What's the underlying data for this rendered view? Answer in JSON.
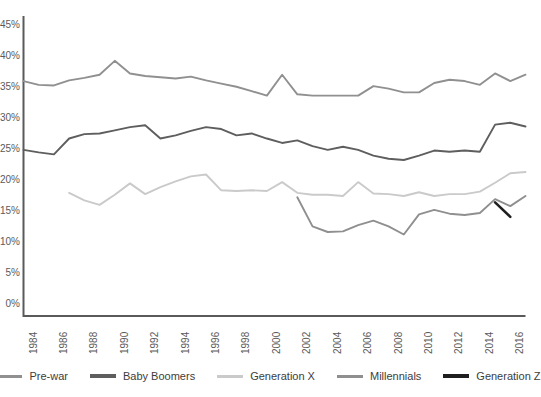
{
  "chart_data": {
    "type": "line",
    "title": "",
    "xlabel": "",
    "ylabel": "",
    "grid": false,
    "legend_position": "bottom",
    "xlim": [
      1984,
      2017
    ],
    "ylim": [
      0,
      50
    ],
    "yticks": [
      "45%",
      "40%",
      "35%",
      "30%",
      "25%",
      "20%",
      "15%",
      "10%",
      "5%",
      "0%"
    ],
    "xticks": [
      "1984",
      "1986",
      "1988",
      "1990",
      "1992",
      "1994",
      "1996",
      "1998",
      "2000",
      "2002",
      "2004",
      "2006",
      "2008",
      "2010",
      "2012",
      "2014",
      "2016"
    ],
    "x": [
      1984,
      1985,
      1986,
      1987,
      1988,
      1989,
      1990,
      1991,
      1992,
      1993,
      1994,
      1995,
      1996,
      1997,
      1998,
      1999,
      2000,
      2001,
      2002,
      2003,
      2004,
      2005,
      2006,
      2007,
      2008,
      2009,
      2010,
      2011,
      2012,
      2013,
      2014,
      2015,
      2016,
      2017
    ],
    "series": [
      {
        "name": "Pre-war",
        "color": "#909090",
        "x": [
          1984,
          1985,
          1986,
          1987,
          1988,
          1989,
          1990,
          1991,
          1992,
          1993,
          1994,
          1995,
          1996,
          1997,
          1998,
          1999,
          2000,
          2001,
          2002,
          2003,
          2004,
          2005,
          2006,
          2007,
          2008,
          2009,
          2010,
          2011,
          2012,
          2013,
          2014,
          2015,
          2016,
          2017
        ],
        "values": [
          37.2,
          36.6,
          36.5,
          37.3,
          37.7,
          38.2,
          40.4,
          38.4,
          38.0,
          37.8,
          37.6,
          37.9,
          37.3,
          36.8,
          36.3,
          35.6,
          34.9,
          38.2,
          35.1,
          34.9,
          34.9,
          34.9,
          34.9,
          36.4,
          36.0,
          35.4,
          35.4,
          36.9,
          37.4,
          37.2,
          36.6,
          38.4,
          37.2,
          38.2
        ]
      },
      {
        "name": "Baby Boomers",
        "color": "#5e5e5e",
        "x": [
          1984,
          1985,
          1986,
          1987,
          1988,
          1989,
          1990,
          1991,
          1992,
          1993,
          1994,
          1995,
          1996,
          1997,
          1998,
          1999,
          2000,
          2001,
          2002,
          2003,
          2004,
          2005,
          2006,
          2007,
          2008,
          2009,
          2010,
          2011,
          2012,
          2013,
          2014,
          2015,
          2016,
          2017
        ],
        "values": [
          26.3,
          25.9,
          25.6,
          28.1,
          28.8,
          28.9,
          29.4,
          29.9,
          30.2,
          28.1,
          28.6,
          29.3,
          29.9,
          29.6,
          28.6,
          28.9,
          28.1,
          27.4,
          27.8,
          26.9,
          26.3,
          26.8,
          26.3,
          25.4,
          24.9,
          24.7,
          25.4,
          26.2,
          26.0,
          26.2,
          26.0,
          30.3,
          30.6,
          30.0
        ]
      },
      {
        "name": "Generation X",
        "color": "#cacaca",
        "x": [
          1987,
          1988,
          1989,
          1990,
          1991,
          1992,
          1993,
          1994,
          1995,
          1996,
          1997,
          1998,
          1999,
          2000,
          2001,
          2002,
          2003,
          2004,
          2005,
          2006,
          2007,
          2008,
          2009,
          2010,
          2011,
          2012,
          2013,
          2014,
          2015,
          2016,
          2017
        ],
        "values": [
          19.5,
          18.3,
          17.6,
          19.2,
          21.0,
          19.3,
          20.4,
          21.3,
          22.1,
          22.4,
          19.9,
          19.8,
          19.9,
          19.8,
          21.2,
          19.5,
          19.2,
          19.2,
          19.0,
          21.2,
          19.4,
          19.3,
          19.0,
          19.6,
          19.0,
          19.3,
          19.3,
          19.7,
          21.1,
          22.6,
          22.8
        ]
      },
      {
        "name": "Millennials",
        "color": "#8f8f8f",
        "x": [
          2002,
          2003,
          2004,
          2005,
          2006,
          2007,
          2008,
          2009,
          2010,
          2011,
          2012,
          2013,
          2014,
          2015,
          2016,
          2017
        ],
        "values": [
          18.8,
          14.2,
          13.3,
          13.4,
          14.4,
          15.1,
          14.2,
          12.9,
          16.1,
          16.8,
          16.2,
          16.0,
          16.3,
          18.5,
          17.4,
          19.0
        ]
      },
      {
        "name": "Generation Z",
        "color": "#1f1f1f",
        "x": [
          2015,
          2016
        ],
        "values": [
          18.0,
          15.7
        ]
      }
    ]
  },
  "legend": {
    "items": [
      {
        "label": "Pre-war"
      },
      {
        "label": "Baby Boomers"
      },
      {
        "label": "Generation X"
      },
      {
        "label": "Millennials"
      },
      {
        "label": "Generation Z"
      }
    ]
  },
  "axes": {
    "axis_color": "#5a5a5a",
    "tick_text_color": "#5a5a5a"
  }
}
